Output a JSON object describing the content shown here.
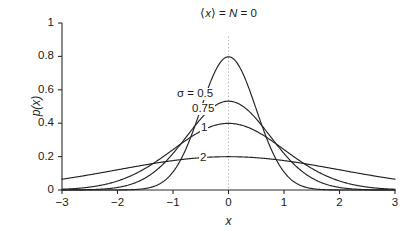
{
  "chart_data": {
    "type": "line",
    "title_parts": {
      "mean_bracket_open": "⟨",
      "mean_var": "x",
      "mean_bracket_close": "⟩",
      "eq1": " = ",
      "n_var": "N",
      "eq2": " = ",
      "value": "0"
    },
    "xlabel": "x",
    "ylabel": "p(x)",
    "xlim": [
      -3,
      3
    ],
    "ylim": [
      0,
      1
    ],
    "xticks": [
      "−3",
      "−2",
      "−1",
      "0",
      "1",
      "2",
      "3"
    ],
    "xtick_values": [
      -3,
      -2,
      -1,
      0,
      1,
      2,
      3
    ],
    "yticks": [
      "0",
      "0.2",
      "0.4",
      "0.6",
      "0.8",
      "1"
    ],
    "ytick_values": [
      0,
      0.2,
      0.4,
      0.6,
      0.8,
      1
    ],
    "grid": false,
    "legend_position": "inline-annotations",
    "annotations": [
      {
        "text": "σ = 0.5",
        "x_px": 176,
        "y_px": 88
      },
      {
        "text": "0.75",
        "x_px": 191,
        "y_px": 103
      },
      {
        "text": "1",
        "x_px": 200,
        "y_px": 122
      },
      {
        "text": "2",
        "x_px": 199,
        "y_px": 152
      }
    ],
    "zero_guide": {
      "x": 0,
      "from_y": 0,
      "to_y": 0.92,
      "style": "dotted",
      "color": "#b9b9b9"
    },
    "series": [
      {
        "name": "σ = 0.5",
        "sigma": 0.5,
        "mu": 0,
        "peak": 0.798,
        "label": "σ = 0.5"
      },
      {
        "name": "0.75",
        "sigma": 0.75,
        "mu": 0,
        "peak": 0.532,
        "label": "0.75"
      },
      {
        "name": "1",
        "sigma": 1,
        "mu": 0,
        "peak": 0.399,
        "label": "1"
      },
      {
        "name": "2",
        "sigma": 2,
        "mu": 0,
        "peak": 0.199,
        "label": "2"
      }
    ],
    "curve_color": "#222222",
    "axis_color": "#2b2b2b",
    "background": "#ffffff"
  },
  "plot_geometry": {
    "left_px": 62,
    "right_px": 395,
    "top_px": 23,
    "bottom_px": 190
  }
}
